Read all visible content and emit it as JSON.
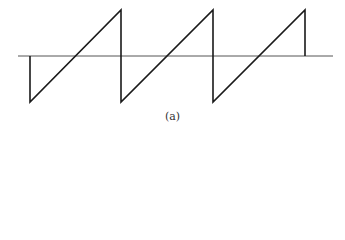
{
  "figure": {
    "caption": "(a)",
    "colors": {
      "waveform": "#1a1a1a",
      "axis": "#555555"
    },
    "axis": {
      "x1": 18,
      "x2": 333,
      "y": 56
    },
    "waveform_points": [
      [
        30,
        56
      ],
      [
        30,
        102
      ],
      [
        121,
        10
      ],
      [
        121,
        102
      ],
      [
        213,
        10
      ],
      [
        213,
        102
      ],
      [
        305,
        10
      ],
      [
        305,
        56
      ]
    ]
  }
}
